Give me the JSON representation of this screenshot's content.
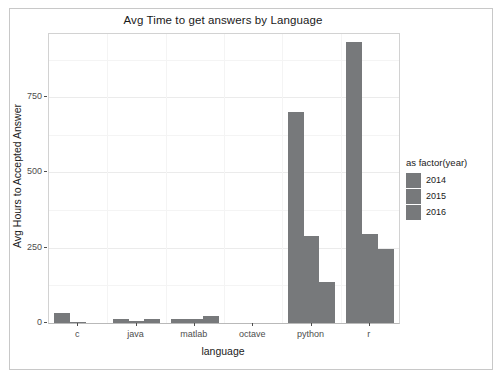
{
  "chart_data": {
    "type": "bar",
    "title": "Avg Time to get answers by Language",
    "xlabel": "language",
    "ylabel": "Avg Hours to Accepted Answer",
    "categories": [
      "c",
      "java",
      "matlab",
      "octave",
      "python",
      "r"
    ],
    "series": [
      {
        "name": "2014",
        "values": [
          33,
          12,
          12,
          0,
          700,
          935
        ]
      },
      {
        "name": "2015",
        "values": [
          2,
          8,
          12,
          0,
          290,
          296
        ]
      },
      {
        "name": "2016",
        "values": [
          0,
          13,
          23,
          0,
          136,
          245
        ]
      }
    ],
    "ylim": [
      0,
      960
    ],
    "yticks": [
      0,
      250,
      500,
      750
    ],
    "ytick_labels": [
      "0",
      "250",
      "500",
      "750"
    ],
    "grid": true,
    "legend": {
      "title": "as factor(year)",
      "position": "right",
      "entries": [
        "2014",
        "2015",
        "2016"
      ]
    },
    "colors": {
      "bar_fill": "#77797b",
      "panel_background": "#ffffff",
      "grid_major": "#ebebeb",
      "grid_minor": "#f4f4f4",
      "axis_text": "#4d4d4d",
      "title_text": "#1a1a1a"
    }
  }
}
